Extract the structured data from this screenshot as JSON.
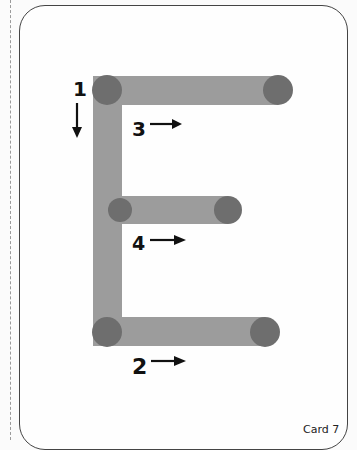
{
  "card": {
    "letter": "E",
    "label": "Card 7"
  },
  "strokes": [
    {
      "order": "1",
      "direction": "down",
      "description": "vertical stroke"
    },
    {
      "order": "2",
      "direction": "right",
      "description": "bottom horizontal stroke"
    },
    {
      "order": "3",
      "direction": "right",
      "description": "top horizontal stroke"
    },
    {
      "order": "4",
      "direction": "right",
      "description": "middle horizontal stroke"
    }
  ],
  "colors": {
    "stroke_bar": "#9c9c9c",
    "stroke_dot": "#6e6e6e",
    "label": "#111111",
    "card_border": "#444444",
    "cut_line": "#9a9a9a"
  }
}
